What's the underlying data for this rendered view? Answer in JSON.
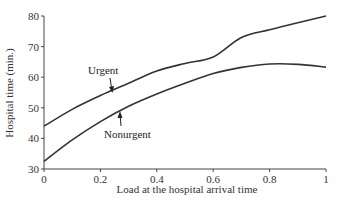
{
  "chart_data": {
    "type": "line",
    "title": "",
    "xlabel": "Load at the hospital arrival time",
    "ylabel": "Hospital time (min.)",
    "xlim": [
      0,
      1
    ],
    "ylim": [
      30,
      80
    ],
    "xticks": [
      "0",
      "0.2",
      "0.4",
      "0.6",
      "0.8",
      "1"
    ],
    "yticks": [
      "30",
      "40",
      "50",
      "60",
      "70",
      "80"
    ],
    "grid": false,
    "legend": "none (inline annotations with arrows)",
    "x": [
      0,
      0.1,
      0.2,
      0.3,
      0.4,
      0.5,
      0.6,
      0.7,
      0.8,
      0.9,
      1.0
    ],
    "series": [
      {
        "name": "Urgent",
        "values": [
          44,
          49.5,
          54,
          58,
          62,
          64.5,
          66.6,
          73,
          75.5,
          77.8,
          80
        ]
      },
      {
        "name": "Nonurgent",
        "values": [
          32.5,
          39.5,
          45.5,
          50.5,
          54.5,
          58,
          61.2,
          63.2,
          64.3,
          64.2,
          63.3
        ]
      }
    ],
    "annotations": [
      {
        "text": "Urgent",
        "points_to": "Urgent",
        "x": 0.22
      },
      {
        "text": "Nonurgent",
        "points_to": "Nonurgent",
        "x": 0.28
      }
    ]
  },
  "colors": {
    "line": "#333333",
    "axis": "#444444"
  }
}
